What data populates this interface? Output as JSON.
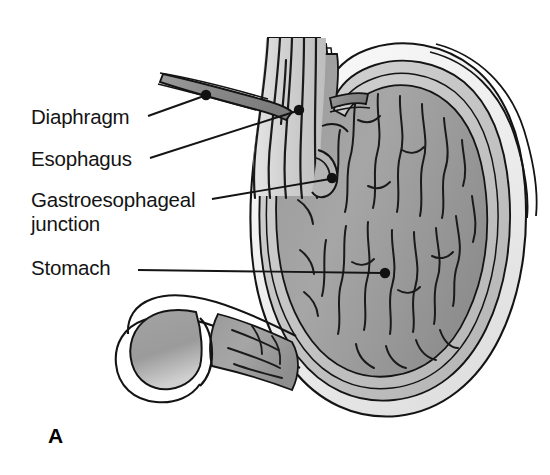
{
  "figure": {
    "panel_label": "A",
    "background_color": "#ffffff",
    "ink_color": "#141414"
  },
  "labels": [
    {
      "id": "diaphragm",
      "text": "Diaphragm",
      "leader_dot": [
        206,
        95
      ]
    },
    {
      "id": "esophagus",
      "text": "Esophagus",
      "leader_dot": [
        299,
        110
      ]
    },
    {
      "id": "gastroesophageal_junction",
      "line1": "Gastroesophageal",
      "line2": "junction",
      "leader_dot": [
        332,
        178
      ]
    },
    {
      "id": "stomach",
      "text": "Stomach",
      "leader_dot": [
        385,
        273
      ]
    }
  ],
  "palette": {
    "outline": "#141414",
    "serosa_light": "#f2f2f2",
    "muscularis_mid": "#c9c9c9",
    "mucosa_gray": "#a8a8a8",
    "lumen_dark": "#8f8f8f",
    "diaphragm_band": "#8c8c8c",
    "esophagus_fill": "#d4d4d4",
    "rugae_stroke": "#1a1a1a"
  },
  "structures": [
    "diaphragm",
    "esophagus",
    "gastroesophageal junction",
    "fundus",
    "body of stomach",
    "rugae",
    "antrum",
    "pylorus",
    "duodenal bulb",
    "greater curvature",
    "lesser curvature"
  ]
}
